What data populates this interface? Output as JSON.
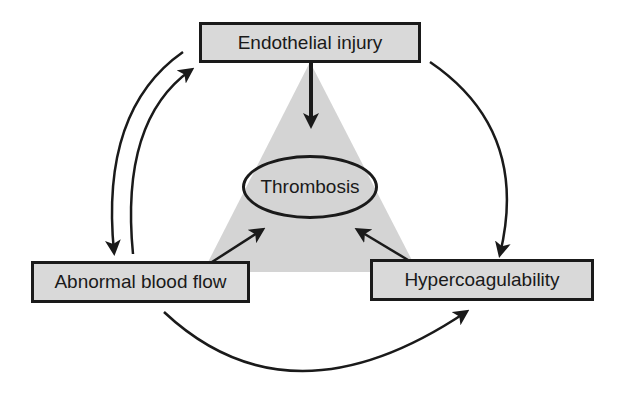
{
  "diagram": {
    "center": {
      "label": "Thrombosis"
    },
    "nodes": [
      {
        "id": "endothelial",
        "label": "Endothelial injury"
      },
      {
        "id": "flow",
        "label": "Abnormal blood flow"
      },
      {
        "id": "hyper",
        "label": "Hypercoagulability"
      }
    ],
    "edges": [
      {
        "from": "Endothelial injury",
        "to": "Thrombosis"
      },
      {
        "from": "Abnormal blood flow",
        "to": "Thrombosis"
      },
      {
        "from": "Hypercoagulability",
        "to": "Thrombosis"
      },
      {
        "from": "Endothelial injury",
        "to": "Abnormal blood flow"
      },
      {
        "from": "Abnormal blood flow",
        "to": "Endothelial injury"
      },
      {
        "from": "Endothelial injury",
        "to": "Hypercoagulability"
      },
      {
        "from": "Abnormal blood flow",
        "to": "Hypercoagulability"
      }
    ],
    "colors": {
      "fill": "#d9d9d9",
      "stroke": "#1a1a1a",
      "triangle": "#d4d4d4"
    }
  }
}
